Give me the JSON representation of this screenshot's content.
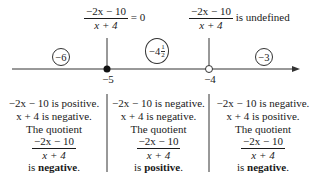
{
  "top_labels": {
    "left": {
      "numerator": "−2x − 10",
      "denominator": "x + 4",
      "suffix": "= 0"
    },
    "right": {
      "numerator": "−2x − 10",
      "denominator": "x + 4",
      "suffix": "is undefined"
    }
  },
  "test_points": [
    {
      "label": "−6"
    },
    {
      "whole": "−4",
      "num": "1",
      "den": "2"
    },
    {
      "label": "−3"
    }
  ],
  "axis": {
    "critical_points": [
      {
        "value": "−5",
        "marker": "filled"
      },
      {
        "value": "−4",
        "marker": "open"
      }
    ],
    "colors": {
      "line": "#333333",
      "text": "#1a1a1a"
    }
  },
  "regions": [
    {
      "line1": "−2x − 10 is positive.",
      "line2": "x + 4 is negative.",
      "line3": "The quotient",
      "frac_num": "−2x − 10",
      "frac_den": "x + 4",
      "result_prefix": "is",
      "result": "negative",
      "result_suffix": "."
    },
    {
      "line1": "−2x − 10 is negative.",
      "line2": "x + 4 is negative.",
      "line3": "The quotient",
      "frac_num": "−2x − 10",
      "frac_den": "x + 4",
      "result_prefix": "is",
      "result": "positive",
      "result_suffix": "."
    },
    {
      "line1": "−2x − 10 is negative.",
      "line2": "x + 4 is positive.",
      "line3": "The quotient",
      "frac_num": "−2x − 10",
      "frac_den": "x + 4",
      "result_prefix": "is",
      "result": "negative",
      "result_suffix": "."
    }
  ]
}
